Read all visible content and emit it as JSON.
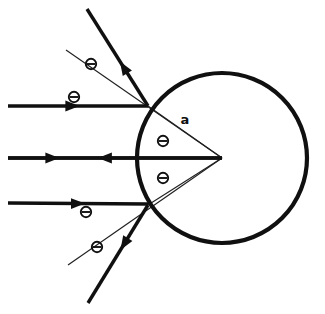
{
  "figure": {
    "background_color": "#ffffff",
    "stroke_color": "#101010",
    "width": 325,
    "height": 314
  },
  "sphere": {
    "name": "sphere",
    "center_x": 222,
    "center_y": 158,
    "radius": 85,
    "stroke_width": 4.2
  },
  "labels": {
    "radius_label": "a",
    "radius_label_x": 185,
    "radius_label_y": 124,
    "angle_symbol": "Θ"
  },
  "angle_markers": [
    {
      "id": "theta-upper-reflected",
      "symbol": "Θ",
      "x": 91,
      "y": 64
    },
    {
      "id": "theta-upper-incident",
      "symbol": "Θ",
      "x": 74,
      "y": 97
    },
    {
      "id": "theta-inner-upper",
      "symbol": "Θ",
      "x": 163,
      "y": 141
    },
    {
      "id": "theta-inner-lower",
      "symbol": "Θ",
      "x": 163,
      "y": 178
    },
    {
      "id": "theta-lower-incident",
      "symbol": "Θ",
      "x": 86,
      "y": 212
    },
    {
      "id": "theta-lower-reflected",
      "symbol": "Θ",
      "x": 97,
      "y": 247
    }
  ],
  "incident_rays": [
    {
      "id": "incident-ray-top",
      "x1": 8,
      "y1": 106,
      "x2": 148,
      "y2": 106,
      "arrow_at": 0.51,
      "arrow_angle": 0
    },
    {
      "id": "incident-ray-middle",
      "x1": 8,
      "y1": 158,
      "x2": 222,
      "y2": 158,
      "arrow_at": 0.24,
      "arrow_angle": 0
    },
    {
      "id": "incident-ray-bottom",
      "x1": 8,
      "y1": 203,
      "x2": 148,
      "y2": 204,
      "arrow_at": 0.55,
      "arrow_angle": 0
    }
  ],
  "reflected_rays": [
    {
      "id": "reflected-ray-top",
      "x1": 148,
      "y1": 106,
      "x2": 87,
      "y2": 9,
      "arrow_at": 0.46,
      "arrow_angle": 238
    },
    {
      "id": "reflected-ray-middle",
      "x1": 222,
      "y1": 158,
      "x2": 8,
      "y2": 158,
      "arrow_at": 0.58,
      "arrow_angle": 180
    },
    {
      "id": "reflected-ray-bottom",
      "x1": 148,
      "y1": 205,
      "x2": 88,
      "y2": 303,
      "arrow_at": 0.46,
      "arrow_angle": 122
    }
  ],
  "normal_lines": [
    {
      "id": "normal-line-upper",
      "x1": 222,
      "y1": 158,
      "x2": 66,
      "y2": 50
    },
    {
      "id": "normal-line-lower",
      "x1": 222,
      "y1": 158,
      "x2": 68,
      "y2": 265
    }
  ],
  "chord_lines": [
    {
      "id": "chord-upper",
      "x1": 148,
      "y1": 106,
      "x2": 222,
      "y2": 158
    },
    {
      "id": "chord-lower",
      "x1": 148,
      "y1": 205,
      "x2": 222,
      "y2": 158
    }
  ]
}
